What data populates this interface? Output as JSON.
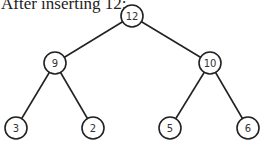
{
  "caption": "After inserting 12:",
  "tree": {
    "nodes": [
      {
        "id": "n12",
        "label": "12",
        "x": 132,
        "y": 16
      },
      {
        "id": "n9",
        "label": "9",
        "x": 55,
        "y": 63
      },
      {
        "id": "n10",
        "label": "10",
        "x": 210,
        "y": 63
      },
      {
        "id": "n3",
        "label": "3",
        "x": 16,
        "y": 128
      },
      {
        "id": "n2",
        "label": "2",
        "x": 93,
        "y": 128
      },
      {
        "id": "n5",
        "label": "5",
        "x": 170,
        "y": 128
      },
      {
        "id": "n6",
        "label": "6",
        "x": 248,
        "y": 128
      }
    ],
    "edges": [
      [
        "n12",
        "n9"
      ],
      [
        "n12",
        "n10"
      ],
      [
        "n9",
        "n3"
      ],
      [
        "n9",
        "n2"
      ],
      [
        "n10",
        "n5"
      ],
      [
        "n10",
        "n6"
      ]
    ],
    "node_radius": 11
  }
}
